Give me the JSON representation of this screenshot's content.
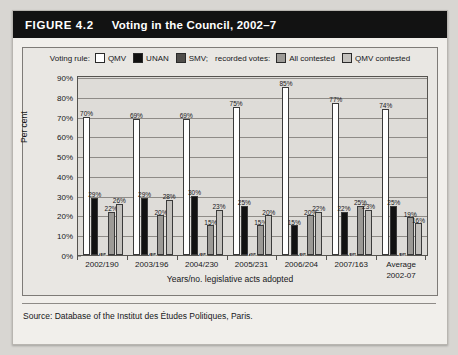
{
  "figure": {
    "number": "FIGURE 4.2",
    "title": "Voting in the Council, 2002–7"
  },
  "source": "Source: Database of the Institut des Études Politiques, Paris.",
  "legend": {
    "voting_rule_label": "Voting rule:",
    "recorded_votes_label": "recorded votes:",
    "entries": [
      {
        "label": "QMV",
        "color": "#ffffff"
      },
      {
        "label": "UNAN",
        "color": "#111111"
      },
      {
        "label": "SMV;",
        "color": "#4f4d4a"
      },
      {
        "label": "All contested",
        "color": "#9c9a96"
      },
      {
        "label": "QMV contested",
        "color": "#c3c1bd"
      }
    ]
  },
  "chart_data": {
    "type": "bar",
    "title": "Voting in the Council, 2002–7",
    "xlabel": "Years/no. legislative acts adopted",
    "ylabel": "Per cent",
    "ylim": [
      0,
      90
    ],
    "ytick_step": 10,
    "grid": true,
    "legend_position": "top",
    "ytick_labels": [
      "0%",
      "10%",
      "20%",
      "30%",
      "40%",
      "50%",
      "60%",
      "70%",
      "80%",
      "90%"
    ],
    "categories": [
      "2002/190",
      "2003/196",
      "2004/230",
      "2005/231",
      "2006/204",
      "2007/163",
      "Average\n2002-07"
    ],
    "category_lines": [
      [
        "2002/190"
      ],
      [
        "2003/196"
      ],
      [
        "2004/230"
      ],
      [
        "2005/231"
      ],
      [
        "2006/204"
      ],
      [
        "2007/163"
      ],
      [
        "Average",
        "2002-07"
      ]
    ],
    "series": [
      {
        "name": "QMV",
        "color": "#ffffff",
        "values": [
          70,
          69,
          69,
          75,
          85,
          77,
          74
        ],
        "labels": [
          "70%",
          "69%",
          "69%",
          "75%",
          "85%",
          "77%",
          "74%"
        ]
      },
      {
        "name": "UNAN",
        "color": "#111111",
        "values": [
          29,
          29,
          30,
          25,
          15,
          22,
          25
        ],
        "labels": [
          "29%",
          "29%",
          "30%",
          "25%",
          "15%",
          "22%",
          "25%"
        ]
      },
      {
        "name": "SMV",
        "color": "#4f4d4a",
        "values": [
          1,
          1,
          1,
          0,
          1,
          1,
          1
        ],
        "labels": [
          "1%",
          "1%",
          "1%",
          "0%",
          "1%",
          "1%",
          "1%"
        ]
      },
      {
        "name": "All contested",
        "color": "#9c9a96",
        "values": [
          22,
          20,
          15,
          15,
          20,
          25,
          19
        ],
        "labels": [
          "22%",
          "20%",
          "15%",
          "15%",
          "20%",
          "25%",
          "19%"
        ]
      },
      {
        "name": "QMV contested",
        "color": "#c3c1bd",
        "values": [
          26,
          28,
          23,
          20,
          22,
          23,
          16
        ],
        "labels": [
          "26%",
          "28%",
          "23%",
          "20%",
          "22%",
          "23%",
          "16%"
        ]
      }
    ]
  }
}
